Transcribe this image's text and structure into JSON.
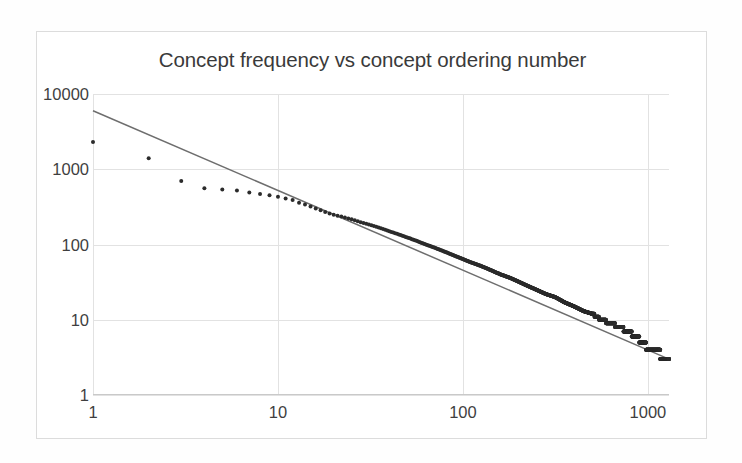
{
  "chart_data": {
    "type": "scatter",
    "title": "Concept frequency vs concept ordering number",
    "xlabel": "",
    "ylabel": "",
    "xscale": "log",
    "yscale": "log",
    "xlim": [
      1,
      1300
    ],
    "ylim": [
      1,
      10000
    ],
    "grid": true,
    "legend": false,
    "x_tick_labels": [
      "1",
      "10",
      "100",
      "1000"
    ],
    "x_tick_values": [
      1,
      10,
      100,
      1000
    ],
    "y_tick_labels": [
      "1",
      "10",
      "100",
      "1000",
      "10000"
    ],
    "y_tick_values": [
      1,
      10,
      100,
      1000,
      10000
    ],
    "series": [
      {
        "name": "concept frequency",
        "type": "scatter",
        "marker": "circle",
        "color": "#2b2b2b",
        "marker_size": 4,
        "note": "Zipf-like rank/frequency distribution; head is flattened below the power law, tail shows integer-valued staircase down to 3",
        "points": [
          [
            1,
            2300
          ],
          [
            2,
            1400
          ],
          [
            3,
            700
          ],
          [
            4,
            560
          ],
          [
            5,
            540
          ],
          [
            6,
            520
          ],
          [
            7,
            490
          ],
          [
            8,
            470
          ],
          [
            9,
            450
          ],
          [
            10,
            430
          ],
          [
            11,
            410
          ],
          [
            12,
            390
          ],
          [
            13,
            360
          ],
          [
            14,
            340
          ],
          [
            15,
            320
          ],
          [
            16,
            300
          ],
          [
            17,
            285
          ],
          [
            18,
            270
          ],
          [
            19,
            258
          ],
          [
            20,
            248
          ],
          [
            22,
            235
          ],
          [
            24,
            222
          ],
          [
            26,
            210
          ],
          [
            28,
            198
          ],
          [
            30,
            188
          ],
          [
            33,
            176
          ],
          [
            36,
            164
          ],
          [
            40,
            150
          ],
          [
            45,
            136
          ],
          [
            50,
            124
          ],
          [
            56,
            112
          ],
          [
            63,
            100
          ],
          [
            70,
            91
          ],
          [
            80,
            80
          ],
          [
            90,
            71
          ],
          [
            100,
            64
          ],
          [
            110,
            58
          ],
          [
            125,
            52
          ],
          [
            140,
            46
          ],
          [
            160,
            40
          ],
          [
            180,
            36
          ],
          [
            200,
            32
          ],
          [
            225,
            28
          ],
          [
            250,
            25
          ],
          [
            280,
            22
          ],
          [
            315,
            20
          ],
          [
            355,
            17
          ],
          [
            400,
            15
          ],
          [
            450,
            13
          ],
          [
            500,
            12
          ],
          [
            560,
            10
          ],
          [
            630,
            9
          ],
          [
            700,
            8
          ],
          [
            780,
            7
          ],
          [
            860,
            6
          ],
          [
            940,
            5
          ],
          [
            1020,
            4
          ],
          [
            1120,
            4
          ],
          [
            1220,
            3
          ],
          [
            1300,
            3
          ]
        ]
      },
      {
        "name": "power-law trend line",
        "type": "line",
        "color": "#6e6e6e",
        "width": 1.5,
        "endpoints": [
          [
            1,
            6000
          ],
          [
            1300,
            3
          ]
        ],
        "slope_loglog": -1.06
      }
    ]
  },
  "chart": {
    "title": "Concept frequency vs concept ordering number",
    "y_ticks": [
      {
        "label": "10000",
        "value": 10000
      },
      {
        "label": "1000",
        "value": 1000
      },
      {
        "label": "100",
        "value": 100
      },
      {
        "label": "10",
        "value": 10
      },
      {
        "label": "1",
        "value": 1
      }
    ],
    "x_ticks": [
      {
        "label": "1",
        "value": 1
      },
      {
        "label": "10",
        "value": 10
      },
      {
        "label": "100",
        "value": 100
      },
      {
        "label": "1000",
        "value": 1000
      }
    ],
    "colors": {
      "marker": "#2b2b2b",
      "trendline": "#6e6e6e",
      "gridline": "#e2e2e2",
      "axis": "#c9c9c9",
      "border": "#dcdcdc",
      "text": "#3f3f3f",
      "background": "#ffffff"
    }
  }
}
